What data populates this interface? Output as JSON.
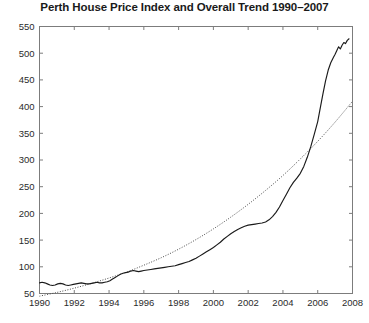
{
  "chart_data": {
    "type": "line",
    "title": "Perth House Price Index and Overall Trend 1990–2007",
    "xlabel": "",
    "ylabel": "",
    "xlim": [
      1990,
      2008
    ],
    "ylim": [
      50,
      550
    ],
    "xticks": [
      1990,
      1992,
      1994,
      1996,
      1998,
      2000,
      2002,
      2004,
      2006,
      2008
    ],
    "yticks": [
      50,
      100,
      150,
      200,
      250,
      300,
      350,
      400,
      450,
      500,
      550
    ],
    "xtick_labels": [
      "1990",
      "1992",
      "1994",
      "1996",
      "1998",
      "2000",
      "2002",
      "2004",
      "2006",
      "2008"
    ],
    "ytick_labels": [
      "50",
      "100",
      "150",
      "200",
      "250",
      "300",
      "350",
      "400",
      "450",
      "500",
      "550"
    ],
    "grid": false,
    "legend": false,
    "series": [
      {
        "name": "Perth House Price Index",
        "style": "solid",
        "color": "#1a1a1a",
        "x": [
          1990.0,
          1990.15,
          1990.3,
          1990.45,
          1990.6,
          1990.75,
          1990.9,
          1991.05,
          1991.2,
          1991.35,
          1991.5,
          1991.65,
          1991.8,
          1991.95,
          1992.1,
          1992.25,
          1992.4,
          1992.55,
          1992.7,
          1992.85,
          1993.0,
          1993.15,
          1993.3,
          1993.45,
          1993.6,
          1993.75,
          1993.9,
          1994.05,
          1994.2,
          1994.35,
          1994.5,
          1994.65,
          1994.8,
          1994.95,
          1995.1,
          1995.25,
          1995.4,
          1995.55,
          1995.7,
          1995.85,
          1996.0,
          1996.2,
          1996.4,
          1996.6,
          1996.8,
          1997.0,
          1997.2,
          1997.4,
          1997.6,
          1997.8,
          1998.0,
          1998.2,
          1998.4,
          1998.6,
          1998.8,
          1999.0,
          1999.2,
          1999.4,
          1999.6,
          1999.8,
          2000.0,
          2000.2,
          2000.4,
          2000.6,
          2000.8,
          2001.0,
          2001.2,
          2001.4,
          2001.6,
          2001.8,
          2002.0,
          2002.2,
          2002.4,
          2002.6,
          2002.8,
          2003.0,
          2003.2,
          2003.4,
          2003.6,
          2003.8,
          2004.0,
          2004.2,
          2004.4,
          2004.6,
          2004.8,
          2005.0,
          2005.2,
          2005.4,
          2005.6,
          2005.8,
          2006.0,
          2006.15,
          2006.3,
          2006.45,
          2006.6,
          2006.75,
          2006.9,
          2007.0,
          2007.1,
          2007.2,
          2007.3,
          2007.4,
          2007.5,
          2007.6,
          2007.7,
          2007.8
        ],
        "y": [
          70,
          71,
          70,
          68,
          66,
          65,
          66,
          68,
          69,
          68,
          66,
          65,
          66,
          67,
          68,
          69,
          70,
          69,
          68,
          68,
          69,
          70,
          71,
          70,
          70,
          71,
          72,
          74,
          77,
          80,
          83,
          86,
          88,
          89,
          90,
          92,
          93,
          92,
          91,
          92,
          93,
          94,
          95,
          96,
          97,
          98,
          99,
          100,
          101,
          102,
          104,
          106,
          108,
          110,
          113,
          116,
          120,
          124,
          128,
          132,
          136,
          141,
          146,
          152,
          157,
          162,
          166,
          170,
          173,
          176,
          178,
          179,
          180,
          181,
          182,
          184,
          188,
          194,
          202,
          212,
          224,
          236,
          248,
          258,
          266,
          275,
          288,
          305,
          325,
          348,
          372,
          398,
          424,
          448,
          468,
          482,
          492,
          498,
          505,
          512,
          508,
          515,
          520,
          518,
          524,
          527
        ]
      },
      {
        "name": "Overall Trend",
        "style": "dotted",
        "color": "#4a4a4a",
        "x": [
          1990,
          1991,
          1992,
          1993,
          1994,
          1995,
          1996,
          1997,
          1998,
          1999,
          2000,
          2001,
          2002,
          2003,
          2004,
          2005,
          2006,
          2007,
          2008
        ],
        "y": [
          45,
          52,
          60,
          69,
          79,
          90,
          103,
          117,
          133,
          151,
          171,
          193,
          217,
          243,
          271,
          302,
          335,
          371,
          410
        ]
      }
    ]
  }
}
